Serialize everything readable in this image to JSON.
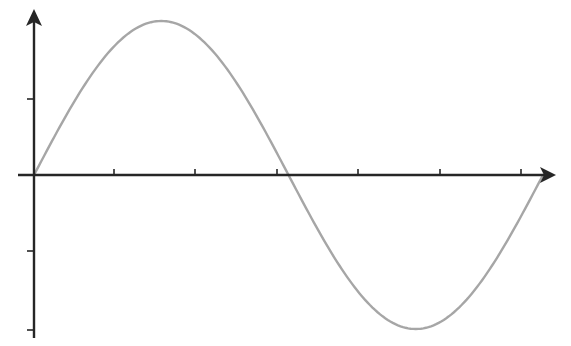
{
  "diagram": {
    "type": "sine-wave",
    "colors": {
      "axis": "#262626",
      "curve": "#a6a6a6",
      "background": "#ffffff"
    },
    "axes": {
      "origin": [
        34,
        175
      ],
      "x_axis": {
        "from": 18,
        "to": 555,
        "ticks": [
          114,
          195,
          277,
          358,
          440,
          521
        ]
      },
      "y_axis": {
        "from": 338,
        "to": 10,
        "ticks": [
          99,
          251,
          330
        ]
      }
    },
    "curve": {
      "x_start": 34,
      "x_end": 543,
      "baseline_y": 175,
      "amplitude": 154,
      "periods": 1
    }
  }
}
